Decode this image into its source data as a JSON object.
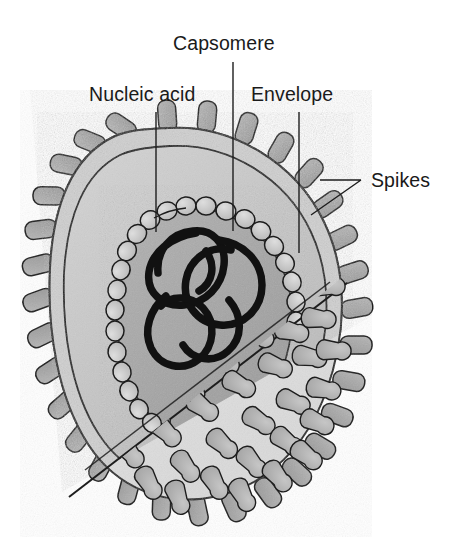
{
  "figure": {
    "background_color": "#ffffff"
  },
  "labels": [
    {
      "id": "capsomere",
      "text": "Capsomere",
      "text_x": 173,
      "text_y": 50,
      "anchor": "start",
      "leader": "M 233 62 L 233 231"
    },
    {
      "id": "nucleic-acid",
      "text": "Nucleic acid",
      "text_x": 89,
      "text_y": 101,
      "anchor": "start",
      "leader": "M 156 112 L 156 232"
    },
    {
      "id": "envelope",
      "text": "Envelope",
      "text_x": 251,
      "text_y": 101,
      "anchor": "start",
      "leader": "M 299 112 L 299 253"
    },
    {
      "id": "spikes",
      "text": "Spikes",
      "text_x": 371,
      "text_y": 187,
      "anchor": "start",
      "leader": "M 361 180 L 320 180 M 361 180 L 311 215"
    }
  ],
  "colors": {
    "outline": "#1d1d1d",
    "envelope_wall": "#cfcfcf",
    "envelope_interior": "#c4c4c4",
    "capsid_core": "#a6a6a6",
    "outer_shell": "#e2e2e2",
    "spike": "#a9a9a9",
    "spike_dark": "#9a9a9a",
    "capsomere_bead": "#c9c9c9",
    "nucleic_acid": "#111111",
    "label_text": "#1a1a1a"
  },
  "structure": {
    "parts": [
      "envelope",
      "spikes",
      "capsomere",
      "nucleic_acid"
    ],
    "spike_count_silhouette": 38,
    "capsomere_ring_count": 30,
    "surface_spike_count": 44
  }
}
